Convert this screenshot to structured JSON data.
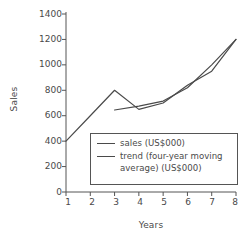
{
  "chart_data": {
    "type": "line",
    "title": "",
    "xlabel": "Years",
    "ylabel": "Sales",
    "x": [
      1,
      2,
      3,
      4,
      5,
      6,
      7,
      8
    ],
    "xlim": [
      1,
      8
    ],
    "ylim": [
      0,
      1400
    ],
    "yticks": [
      0,
      200,
      400,
      600,
      800,
      1000,
      1200,
      1400
    ],
    "xticks": [
      1,
      2,
      3,
      4,
      5,
      6,
      7,
      8
    ],
    "grid": false,
    "legend_position": "lower center",
    "series": [
      {
        "name": "sales (US$000)",
        "x": [
          1,
          2,
          3,
          4,
          5,
          6,
          7,
          8
        ],
        "values": [
          400,
          600,
          800,
          650,
          700,
          840,
          950,
          1200
        ],
        "color": "#4a4a4a"
      },
      {
        "name": "trend (four-year moving average) (US$000)",
        "x": [
          3,
          4,
          5,
          6,
          7,
          8
        ],
        "values": [
          645,
          675,
          715,
          820,
          1000,
          1200
        ],
        "color": "#4a4a4a"
      }
    ]
  },
  "axes": {
    "ylabel": "Sales",
    "xlabel": "Years",
    "ytick_labels": [
      "1400",
      "1200",
      "1000",
      "800",
      "600",
      "400",
      "200",
      "0"
    ],
    "xtick_labels": [
      "1",
      "2",
      "3",
      "4",
      "5",
      "6",
      "7",
      "8"
    ]
  },
  "legend": {
    "items": [
      {
        "label": "sales (US$000)"
      },
      {
        "label": "trend (four-year moving\naverage) (US$000)"
      }
    ]
  },
  "colors": {
    "line": "#4a4a4a",
    "axis": "#555555",
    "text": "#4a4a4a",
    "background": "#ffffff"
  }
}
